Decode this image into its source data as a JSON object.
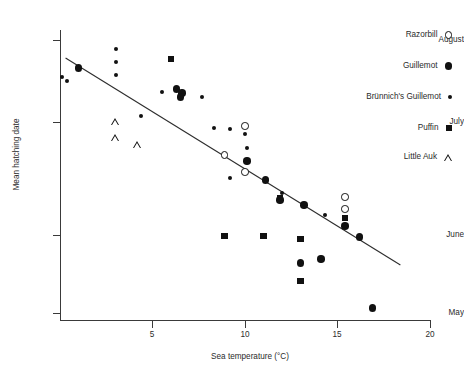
{
  "chart_data": {
    "type": "scatter",
    "title": "",
    "xlabel": "Sea temperature (°C)",
    "ylabel": "Mean hatching date",
    "xlim": [
      0,
      20
    ],
    "xticks": [
      5,
      10,
      15,
      20
    ],
    "xtick_labels": [
      "5",
      "10",
      "15",
      "20"
    ],
    "ylim_labels": [
      "May",
      "June",
      "July",
      "August"
    ],
    "yticks": [
      "May",
      "June",
      "July",
      "August"
    ],
    "grid": false,
    "legend_position": "top-right",
    "trendline": {
      "x0": 0.3,
      "y0_px": 58,
      "x1": 18.4,
      "y1_px": 265,
      "style": "solid"
    },
    "series": [
      {
        "name": "Razorbill",
        "marker": "open-circle",
        "points": [
          {
            "x": 10.0,
            "y_px": 126
          },
          {
            "x": 8.9,
            "y_px": 155
          },
          {
            "x": 10.0,
            "y_px": 172
          },
          {
            "x": 15.4,
            "y_px": 197
          },
          {
            "x": 15.4,
            "y_px": 209
          }
        ]
      },
      {
        "name": "Guillemot",
        "marker": "filled-circle",
        "points": [
          {
            "x": 1.0,
            "y_px": 68
          },
          {
            "x": 6.3,
            "y_px": 89
          },
          {
            "x": 6.6,
            "y_px": 93
          },
          {
            "x": 6.5,
            "y_px": 97
          },
          {
            "x": 10.1,
            "y_px": 161
          },
          {
            "x": 11.1,
            "y_px": 180
          },
          {
            "x": 11.9,
            "y_px": 200
          },
          {
            "x": 13.2,
            "y_px": 205
          },
          {
            "x": 15.4,
            "y_px": 226
          },
          {
            "x": 16.2,
            "y_px": 237
          },
          {
            "x": 13.0,
            "y_px": 263
          },
          {
            "x": 14.1,
            "y_px": 259
          },
          {
            "x": 16.9,
            "y_px": 308
          }
        ]
      },
      {
        "name": "Brünnich's Guillemot",
        "marker": "small-filled-circle",
        "points": [
          {
            "x": 0.1,
            "y_px": 77
          },
          {
            "x": 0.4,
            "y_px": 81
          },
          {
            "x": 3.0,
            "y_px": 49
          },
          {
            "x": 3.0,
            "y_px": 62
          },
          {
            "x": 3.0,
            "y_px": 75
          },
          {
            "x": 5.5,
            "y_px": 92
          },
          {
            "x": 7.7,
            "y_px": 97
          },
          {
            "x": 4.4,
            "y_px": 116
          },
          {
            "x": 8.3,
            "y_px": 128
          },
          {
            "x": 9.2,
            "y_px": 129
          },
          {
            "x": 10.0,
            "y_px": 134
          },
          {
            "x": 10.1,
            "y_px": 148
          },
          {
            "x": 9.2,
            "y_px": 178
          },
          {
            "x": 12.0,
            "y_px": 193
          },
          {
            "x": 14.3,
            "y_px": 215
          }
        ]
      },
      {
        "name": "Puffin",
        "marker": "filled-square",
        "points": [
          {
            "x": 6.0,
            "y_px": 59
          },
          {
            "x": 11.9,
            "y_px": 198
          },
          {
            "x": 8.9,
            "y_px": 236
          },
          {
            "x": 11.0,
            "y_px": 236
          },
          {
            "x": 15.4,
            "y_px": 218
          },
          {
            "x": 13.0,
            "y_px": 239
          },
          {
            "x": 13.0,
            "y_px": 281
          }
        ]
      },
      {
        "name": "Little Auk",
        "marker": "open-triangle",
        "points": [
          {
            "x": 3.0,
            "y_px": 122
          },
          {
            "x": 3.0,
            "y_px": 131
          },
          {
            "x": 4.2,
            "y_px": 131
          }
        ]
      }
    ]
  },
  "axes": {
    "y_title": "Mean hatching date",
    "x_title": "Sea temperature (°C)",
    "y_labels": [
      {
        "text": "August",
        "y_px": 40
      },
      {
        "text": "July",
        "y_px": 122
      },
      {
        "text": "June",
        "y_px": 235
      },
      {
        "text": "May",
        "y_px": 313
      }
    ],
    "x_labels": [
      {
        "text": "5",
        "x_px": 152
      },
      {
        "text": "10",
        "x_px": 245
      },
      {
        "text": "15",
        "x_px": 337
      },
      {
        "text": "20",
        "x_px": 430
      }
    ]
  },
  "legend": {
    "items": [
      {
        "label": "Razorbill",
        "marker": "open-circle",
        "y_px": 31
      },
      {
        "label": "Guillemot",
        "marker": "filled-circle",
        "y_px": 62
      },
      {
        "label": "Brünnich's Guillemot",
        "marker": "small-filled-circle",
        "y_px": 93
      },
      {
        "label": "Puffin",
        "marker": "filled-square",
        "y_px": 124
      },
      {
        "label": "Little Auk",
        "marker": "open-triangle",
        "y_px": 153
      }
    ]
  }
}
